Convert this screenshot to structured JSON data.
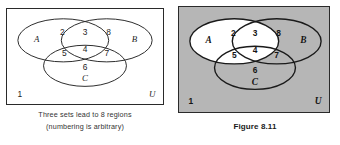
{
  "figure": {
    "sets": [
      "A",
      "B",
      "C"
    ],
    "universe_label": "U",
    "region_numbers": [
      "1",
      "2",
      "3",
      "4",
      "5",
      "6",
      "7",
      "8"
    ],
    "region_count": 8
  },
  "left_panel": {
    "name": "plain-venn-diagram",
    "frame_border_color": "#2a2a2a",
    "background_color": "#ffffff",
    "labels": {
      "set_a": "A",
      "set_b": "B",
      "set_c": "C",
      "universe": "U",
      "r1": "1",
      "r2": "2",
      "r3": "3",
      "r4": "4",
      "r5": "5",
      "r6": "6",
      "r7": "7",
      "r8": "8"
    },
    "caption_line_1": "Three sets lead to 8 regions",
    "caption_line_2": "(numbering is arbitrary)"
  },
  "right_panel": {
    "name": "shaded-venn-diagram",
    "frame_border_color": "#2a2a2a",
    "background_color": "#b6b6b6",
    "shaded_color": "#b6b6b6",
    "unshaded_color": "#ffffff",
    "unshaded_regions": [
      "2",
      "3",
      "4",
      "5"
    ],
    "shaded_regions": [
      "1",
      "6",
      "7",
      "8"
    ],
    "labels": {
      "set_a": "A",
      "set_b": "B",
      "set_c": "C",
      "universe": "U",
      "r1": "1",
      "r2": "2",
      "r3": "3",
      "r4": "4",
      "r5": "5",
      "r6": "6",
      "r7": "7",
      "r8": "8"
    },
    "figure_caption": "Figure 8.11"
  }
}
